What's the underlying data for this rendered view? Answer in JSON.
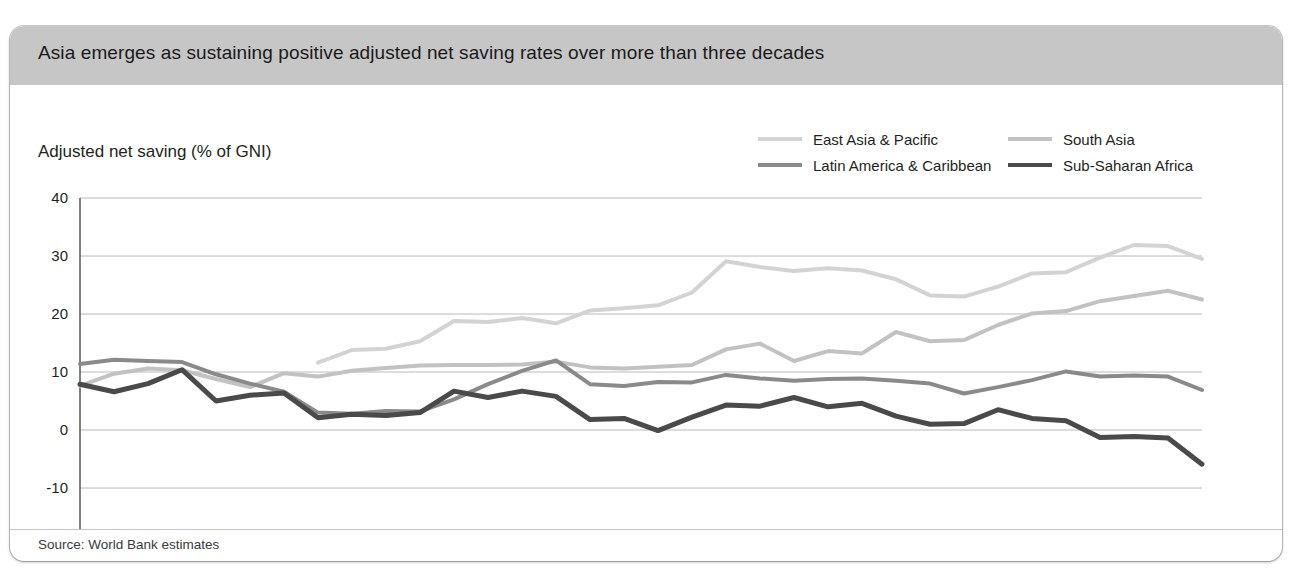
{
  "figure": {
    "title": "Asia emerges as sustaining positive adjusted net saving rates over more than three decades",
    "source": "Source: World Bank estimates",
    "header_background": "#c6c6c6",
    "panel_background": "#ffffff"
  },
  "legend": {
    "items": [
      {
        "label": "East Asia & Pacific",
        "color": "#d3d3d3",
        "column": 0,
        "row": 0
      },
      {
        "label": "South Asia",
        "color": "#c2c2c2",
        "column": 1,
        "row": 0
      },
      {
        "label": "Latin America & Caribbean",
        "color": "#8a8a8a",
        "column": 0,
        "row": 1
      },
      {
        "label": "Sub-Saharan Africa",
        "color": "#4a4a4a",
        "column": 1,
        "row": 1
      }
    ]
  },
  "chart_data": {
    "type": "line",
    "title": "Asia emerges as sustaining positive adjusted net saving rates over more than three decades",
    "subtitle": "",
    "xlabel": "",
    "ylabel": "Adjusted net saving (% of GNI)",
    "ylim": [
      -10,
      40
    ],
    "yticks": [
      40,
      30,
      20,
      10,
      0,
      -10
    ],
    "grid": true,
    "legend_position": "top-right",
    "x": [
      1975,
      1976,
      1977,
      1978,
      1979,
      1980,
      1981,
      1982,
      1983,
      1984,
      1985,
      1986,
      1987,
      1988,
      1989,
      1990,
      1991,
      1992,
      1993,
      1994,
      1995,
      1996,
      1997,
      1998,
      1999,
      2000,
      2001,
      2002,
      2003,
      2004,
      2005,
      2006,
      2007,
      2008
    ],
    "categories": [
      "1975",
      "1976",
      "1977",
      "1978",
      "1979",
      "1980",
      "1981",
      "1982",
      "1983",
      "1984",
      "1985",
      "1986",
      "1987",
      "1988",
      "1989",
      "1990",
      "1991",
      "1992",
      "1993",
      "1994",
      "1995",
      "1996",
      "1997",
      "1998",
      "1999",
      "2000",
      "2001",
      "2002",
      "2003",
      "2004",
      "2005",
      "2006",
      "2007",
      "2008"
    ],
    "series": [
      {
        "name": "East Asia & Pacific",
        "color": "#d3d3d3",
        "width": 4,
        "start_year": 1982,
        "values": [
          null,
          null,
          null,
          null,
          null,
          null,
          null,
          11.6,
          13.8,
          14.0,
          15.3,
          18.8,
          18.6,
          19.3,
          18.4,
          20.6,
          21.0,
          21.5,
          23.7,
          29.1,
          28.1,
          27.4,
          27.9,
          27.5,
          26.0,
          23.2,
          23.0,
          24.7,
          27.0,
          27.2,
          29.7,
          31.9,
          31.7,
          29.5
        ]
      },
      {
        "name": "South Asia",
        "color": "#c2c2c2",
        "width": 4,
        "start_year": 1975,
        "values": [
          7.6,
          9.7,
          10.6,
          10.3,
          8.8,
          7.4,
          9.8,
          9.2,
          10.2,
          10.7,
          11.1,
          11.2,
          11.2,
          11.3,
          11.8,
          10.8,
          10.6,
          10.9,
          11.2,
          13.9,
          14.9,
          11.9,
          13.6,
          13.2,
          16.9,
          15.3,
          15.5,
          18.1,
          20.1,
          20.5,
          22.2,
          23.1,
          24.0,
          22.5
        ]
      },
      {
        "name": "Latin America & Caribbean",
        "color": "#8a8a8a",
        "width": 4,
        "start_year": 1975,
        "values": [
          11.4,
          12.1,
          11.9,
          11.7,
          9.6,
          8.0,
          6.6,
          3.0,
          2.8,
          3.3,
          3.2,
          5.3,
          7.9,
          10.2,
          12.0,
          7.9,
          7.6,
          8.3,
          8.2,
          9.5,
          8.9,
          8.5,
          8.8,
          8.9,
          8.5,
          8.0,
          6.3,
          7.4,
          8.6,
          10.1,
          9.2,
          9.4,
          9.2,
          6.9
        ]
      },
      {
        "name": "Sub-Saharan Africa",
        "color": "#4a4a4a",
        "width": 5,
        "start_year": 1975,
        "values": [
          7.9,
          6.6,
          8.0,
          10.4,
          5.0,
          6.0,
          6.4,
          2.1,
          2.7,
          2.5,
          3.0,
          6.7,
          5.6,
          6.7,
          5.8,
          1.8,
          2.0,
          -0.1,
          2.2,
          4.3,
          4.1,
          5.6,
          4.0,
          4.6,
          2.4,
          1.0,
          1.1,
          3.5,
          2.0,
          1.6,
          -1.3,
          -1.1,
          -1.4,
          -5.9
        ]
      }
    ]
  },
  "axes": {
    "y_tick_labels": [
      "40",
      "30",
      "20",
      "10",
      "0",
      "-10"
    ],
    "x_tick_labels": [
      "1975",
      "1976",
      "1977",
      "1978",
      "1979",
      "1980",
      "1981",
      "1982",
      "1983",
      "1984",
      "1985",
      "1986",
      "1987",
      "1988",
      "1989",
      "1990",
      "1991",
      "1992",
      "1993",
      "1994",
      "1995",
      "1996",
      "1997",
      "1998",
      "1999",
      "2000",
      "2001",
      "2002",
      "2003",
      "2004",
      "2005",
      "2006",
      "2007",
      "2008"
    ]
  }
}
